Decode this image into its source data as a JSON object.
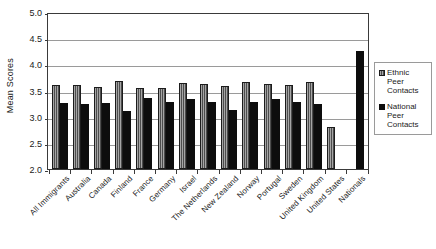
{
  "chart_data": {
    "type": "bar",
    "title": "",
    "xlabel": "",
    "ylabel": "Mean Scores",
    "ylim": [
      2.0,
      5.0
    ],
    "yticks": [
      "2.0",
      "2.5",
      "3.0",
      "3.5",
      "4.0",
      "4.5",
      "5.0"
    ],
    "ytick_values": [
      2.0,
      2.5,
      3.0,
      3.5,
      4.0,
      4.5,
      5.0
    ],
    "grid": true,
    "legend_position": "right",
    "categories": [
      "All Immigrants",
      "Australia",
      "Canada",
      "Finland",
      "France",
      "Germany",
      "Israel",
      "The Netherlands",
      "New Zealand",
      "Norway",
      "Portugal",
      "Sweden",
      "United Kingdom",
      "United States",
      "Nationals"
    ],
    "series": [
      {
        "name": "Ethnic Peer Contacts",
        "color": "#6e6e6e",
        "values": [
          3.6,
          3.61,
          3.57,
          3.68,
          3.55,
          3.55,
          3.64,
          3.62,
          3.59,
          3.66,
          3.62,
          3.6,
          3.67,
          2.8,
          0
        ]
      },
      {
        "name": "National Peer Contacts",
        "color": "#0d0d0d",
        "values": [
          3.26,
          3.25,
          3.26,
          3.11,
          3.35,
          3.29,
          3.34,
          3.28,
          3.13,
          3.28,
          3.33,
          3.29,
          3.25,
          0,
          4.25
        ]
      }
    ]
  },
  "legend": {
    "entries": [
      {
        "label": "Ethnic Peer Contacts",
        "swatch": "ethnic"
      },
      {
        "label": "National Peer Contacts",
        "swatch": "national"
      }
    ]
  }
}
